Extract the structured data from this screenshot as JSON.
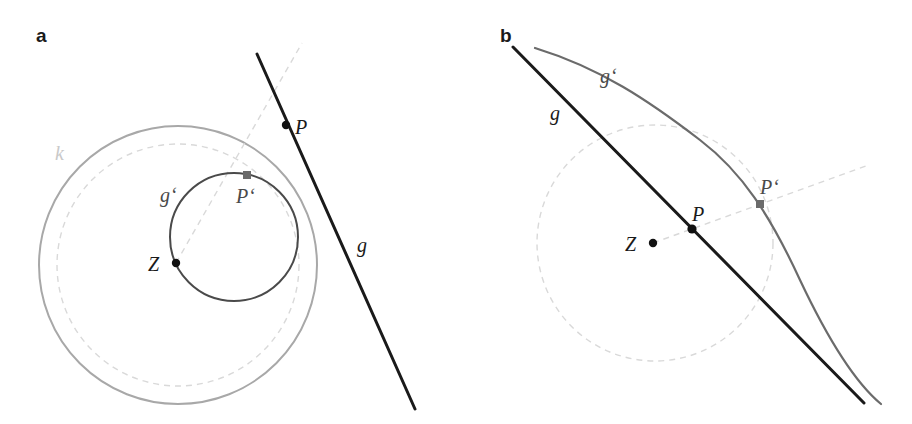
{
  "figure": {
    "width": 912,
    "height": 424,
    "background": "#ffffff",
    "type": "geometric-diagram"
  },
  "colors": {
    "line_black": "#1a1a1a",
    "curve_gray": "#6b6b6b",
    "circle_gray": "#a8a8a8",
    "dashed_light": "#d9d9d9",
    "label_light": "#c9c9c9",
    "point_black": "#111111",
    "point_gray": "#6b6b6b"
  },
  "panels": [
    {
      "id": "a",
      "letter": "a",
      "letter_pos": {
        "x": 36,
        "y": 26
      },
      "center": {
        "name": "Z",
        "x": 176,
        "y": 263
      },
      "labels": [
        {
          "name": "k",
          "text": "k",
          "x": 55,
          "y": 143,
          "tone": "light",
          "role": "inversion-circle-label"
        },
        {
          "name": "g",
          "text": "g",
          "x": 357,
          "y": 235,
          "tone": "dark",
          "role": "line-label"
        },
        {
          "name": "gp",
          "text": "g‘",
          "x": 160,
          "y": 185,
          "tone": "mid",
          "role": "image-circle-label"
        },
        {
          "name": "P",
          "text": "P",
          "x": 295,
          "y": 117,
          "tone": "dark",
          "role": "point-label"
        },
        {
          "name": "Pp",
          "text": "P‘",
          "x": 236,
          "y": 186,
          "tone": "mid",
          "role": "image-point-label"
        },
        {
          "name": "Z",
          "text": "Z",
          "x": 148,
          "y": 254,
          "tone": "dark",
          "role": "center-label"
        }
      ],
      "shapes": {
        "outer_circle_k": {
          "cx": 178,
          "cy": 265,
          "r": 139,
          "stroke": "#a8a8a8",
          "width": 2.0,
          "dashed": false
        },
        "dashed_circle": {
          "cx": 178,
          "cy": 265,
          "r": 121,
          "stroke": "#d9d9d9",
          "width": 1.4,
          "dashed": true
        },
        "image_circle_gp": {
          "cx": 234,
          "cy": 237,
          "r": 64,
          "stroke": "#4a4a4a",
          "width": 2.0,
          "dashed": false
        },
        "line_g": {
          "x1": 257,
          "y1": 54,
          "x2": 415,
          "y2": 409,
          "stroke": "#1a1a1a",
          "width": 3.0
        },
        "ray_ZP": {
          "x1": 176,
          "y1": 263,
          "x2": 302,
          "y2": 43,
          "stroke": "#d9d9d9",
          "width": 1.4,
          "dashed": true
        }
      },
      "points": [
        {
          "name": "Z",
          "x": 176,
          "y": 263,
          "r": 4.2,
          "fill": "#111111",
          "shape": "circle"
        },
        {
          "name": "P",
          "x": 286,
          "y": 125,
          "r": 4.2,
          "fill": "#111111",
          "shape": "circle"
        },
        {
          "name": "Pp",
          "x": 247,
          "y": 175,
          "r": 4.0,
          "fill": "#6b6b6b",
          "shape": "square"
        }
      ]
    },
    {
      "id": "b",
      "letter": "b",
      "letter_pos": {
        "x": 500,
        "y": 26
      },
      "center": {
        "name": "Z",
        "x": 653,
        "y": 243
      },
      "labels": [
        {
          "name": "g",
          "text": "g",
          "x": 550,
          "y": 103,
          "tone": "dark",
          "role": "line-label"
        },
        {
          "name": "gp",
          "text": "g‘",
          "x": 600,
          "y": 66,
          "tone": "mid",
          "role": "image-curve-label"
        },
        {
          "name": "P",
          "text": "P",
          "x": 692,
          "y": 204,
          "tone": "dark",
          "role": "point-label"
        },
        {
          "name": "Pp",
          "text": "P‘",
          "x": 760,
          "y": 177,
          "tone": "mid",
          "role": "image-point-label"
        },
        {
          "name": "Z",
          "text": "Z",
          "x": 625,
          "y": 234,
          "tone": "dark",
          "role": "center-label"
        }
      ],
      "shapes": {
        "dashed_circle": {
          "cx": 655,
          "cy": 243,
          "r": 118,
          "stroke": "#d9d9d9",
          "width": 1.4,
          "dashed": true
        },
        "line_g": {
          "x1": 513,
          "y1": 47,
          "x2": 864,
          "y2": 403,
          "stroke": "#1a1a1a",
          "width": 3.0
        },
        "curve_gp_path": "M 535 48 C 600 68, 648 100, 700 140 C 742 172, 770 215, 800 280 C 825 333, 852 380, 881 404",
        "curve_gp": {
          "stroke": "#6b6b6b",
          "width": 2.2
        },
        "ray_ZP": {
          "x1": 653,
          "y1": 243,
          "x2": 866,
          "y2": 166,
          "stroke": "#d9d9d9",
          "width": 1.4,
          "dashed": true
        }
      },
      "points": [
        {
          "name": "Z",
          "x": 653,
          "y": 243,
          "r": 4.2,
          "fill": "#111111",
          "shape": "circle"
        },
        {
          "name": "P",
          "x": 692,
          "y": 229,
          "r": 4.6,
          "fill": "#111111",
          "shape": "circle"
        },
        {
          "name": "Pp",
          "x": 760,
          "y": 204,
          "r": 4.0,
          "fill": "#6b6b6b",
          "shape": "square"
        }
      ]
    }
  ]
}
